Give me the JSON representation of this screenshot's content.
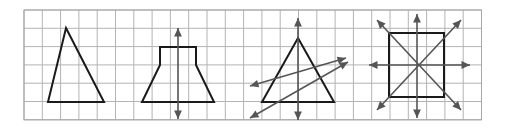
{
  "figure": {
    "width": 511,
    "height": 129,
    "background_color": "#ffffff"
  },
  "grid": {
    "name": "square-grid",
    "x": 24,
    "y": 10,
    "cell_size": 18.3,
    "columns": 25,
    "rows": 6,
    "line_color": "#b3b3b3",
    "line_width": 1,
    "border_color": "#a6a6a6",
    "border_width": 1
  },
  "style": {
    "shape_color": "#1a1a1a",
    "shape_width": 2,
    "symmetry_line_color": "#555555",
    "symmetry_line_width": 1.6,
    "arrow_head_size": 5
  },
  "panels": [
    {
      "id": "panel-1",
      "label": "Triangle with no lines of symmetry",
      "shape": "scalene-triangle",
      "lines_of_symmetry": 0,
      "vertices": [
        [
          66,
          28
        ],
        [
          104,
          102
        ],
        [
          48,
          102
        ]
      ],
      "symmetry_lines": []
    },
    {
      "id": "panel-2",
      "label": "Trapezoid with one line of symmetry",
      "shape": "isosceles-trapezoid",
      "lines_of_symmetry": 1,
      "vertices": [
        [
          160,
          47
        ],
        [
          196,
          47
        ],
        [
          196,
          65
        ],
        [
          214,
          102
        ],
        [
          142,
          102
        ],
        [
          160,
          65
        ]
      ],
      "symmetry_lines": [
        {
          "orientation": "vertical",
          "x1": 178,
          "y1": 28,
          "x2": 178,
          "y2": 119
        }
      ]
    },
    {
      "id": "panel-3",
      "label": "Equilateral triangle with three lines of symmetry",
      "shape": "equilateral-triangle",
      "lines_of_symmetry": 3,
      "vertices": [
        [
          298,
          38
        ],
        [
          334,
          102
        ],
        [
          262,
          102
        ]
      ],
      "symmetry_lines": [
        {
          "orientation": "vertical",
          "x1": 298,
          "y1": 18,
          "x2": 298,
          "y2": 120
        },
        {
          "orientation": "diagonal-up",
          "x1": 250,
          "y1": 86,
          "x2": 346,
          "y2": 58
        },
        {
          "orientation": "diagonal-down",
          "x1": 250,
          "y1": 118,
          "x2": 348,
          "y2": 62
        }
      ]
    },
    {
      "id": "panel-4",
      "label": "Square with four lines of symmetry",
      "shape": "square",
      "lines_of_symmetry": 4,
      "vertices": [
        [
          389,
          33
        ],
        [
          444,
          33
        ],
        [
          444,
          97
        ],
        [
          389,
          97
        ]
      ],
      "symmetry_lines": [
        {
          "orientation": "vertical",
          "x1": 417,
          "y1": 14,
          "x2": 417,
          "y2": 118
        },
        {
          "orientation": "horizontal",
          "x1": 369,
          "y1": 65,
          "x2": 470,
          "y2": 65
        },
        {
          "orientation": "diagonal-up",
          "x1": 377,
          "y1": 110,
          "x2": 461,
          "y2": 20
        },
        {
          "orientation": "diagonal-down",
          "x1": 377,
          "y1": 20,
          "x2": 461,
          "y2": 110
        }
      ]
    }
  ]
}
